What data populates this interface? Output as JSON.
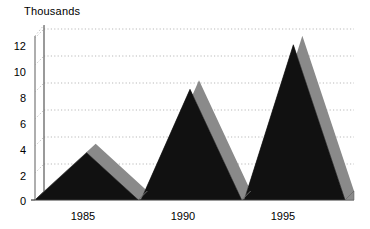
{
  "chart_data": {
    "type": "area",
    "title": "",
    "subtitle": "",
    "xlabel": "",
    "ylabel": "Thousands",
    "axis_unit_label": "Thousands",
    "style": "3d-mountain-area",
    "grid": true,
    "grid_style": "dotted-horizontal",
    "legend": false,
    "legend_position": "none",
    "ylim": [
      0,
      12
    ],
    "y_ticks": [
      0,
      2,
      4,
      6,
      8,
      10,
      12
    ],
    "y_tick_labels": [
      "0",
      "2",
      "4",
      "6",
      "8",
      "10",
      "12"
    ],
    "x_tick_labels": [
      "1985",
      "1990",
      "1995"
    ],
    "categories": [
      "1985",
      "1990",
      "1995"
    ],
    "values": [
      3.5,
      8.2,
      11.5
    ],
    "series": [
      {
        "name": "Series 1",
        "color": "#111111",
        "side_color": "#8a8a8a",
        "points": [
          {
            "x": 0.0,
            "y": 0.0
          },
          {
            "x": 1.0,
            "y": 3.5
          },
          {
            "x": 2.0,
            "y": 0.0
          },
          {
            "x": 2.05,
            "y": 0.0
          },
          {
            "x": 3.0,
            "y": 8.2
          },
          {
            "x": 4.0,
            "y": 0.0
          },
          {
            "x": 4.05,
            "y": 0.0
          },
          {
            "x": 5.0,
            "y": 11.5
          },
          {
            "x": 6.0,
            "y": 0.0
          }
        ]
      }
    ],
    "peak_labels": [
      {
        "category": "1985",
        "value": 3.5
      },
      {
        "category": "1990",
        "value": 8.2
      },
      {
        "category": "1995",
        "value": 11.5
      }
    ],
    "colors": {
      "area_fill": "#111111",
      "area_side": "#8a8a8a",
      "gridline": "#b9b9b9",
      "axis": "#9a9a9a",
      "floor": "#e8e8e8",
      "text": "#000000",
      "background": "#ffffff"
    }
  },
  "axes": {
    "y_title": "Thousands",
    "y_tick_labels": [
      "12",
      "10",
      "8",
      "6",
      "4",
      "2",
      "0"
    ],
    "x_tick_labels": [
      "1985",
      "1990",
      "1995"
    ]
  }
}
